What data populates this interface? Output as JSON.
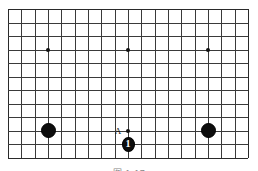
{
  "figure": {
    "kind": "go-board-diagram",
    "board": {
      "columns": 19,
      "rows": 12,
      "line_color": "#3a3a3a",
      "background_color": "#ffffff"
    },
    "star_points": [
      {
        "col": 4,
        "row": 4
      },
      {
        "col": 10,
        "row": 4
      },
      {
        "col": 16,
        "row": 4
      },
      {
        "col": 10,
        "row": 10
      }
    ],
    "stones": [
      {
        "color": "black",
        "col": 4,
        "row": 10,
        "label": ""
      },
      {
        "color": "black",
        "col": 16,
        "row": 10,
        "label": ""
      },
      {
        "color": "black",
        "col": 10,
        "row": 11,
        "label": "1"
      }
    ],
    "point_labels": [
      {
        "text": "A",
        "col": 10,
        "row": 10
      }
    ],
    "stone_color_black": "#0d0d0d",
    "label_text_color": "#ffffff"
  },
  "caption": {
    "text": "图 1-17"
  }
}
